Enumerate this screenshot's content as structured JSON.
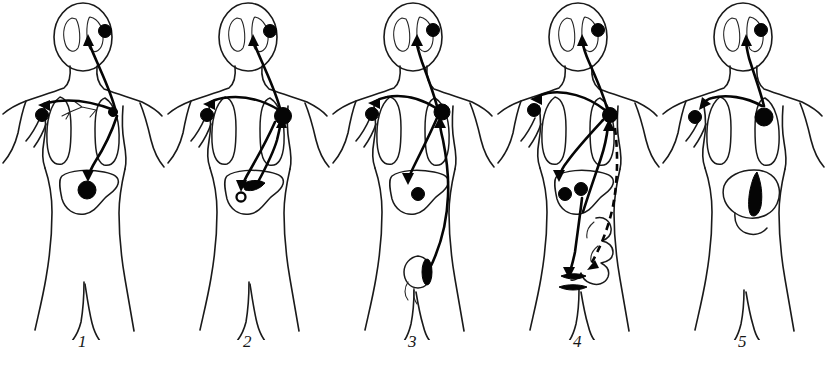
{
  "figure": {
    "panel_count": 5,
    "colors": {
      "ink": "#1a1a1a",
      "lesion_fill": "#050505",
      "background": "#ffffff"
    }
  },
  "panels": [
    {
      "caption": "1",
      "primary_site": "lung",
      "primary_marker": "filled-dot",
      "description": "Lung (bronchial) primary tumour at the right hilum with bronchial tree; metastases to brain, shoulder bone and liver.",
      "metastatic_targets": [
        "brain",
        "shoulder-bone",
        "liver"
      ],
      "markers": [
        {
          "name": "brain-metastasis",
          "type": "filled-dot",
          "site": "brain"
        },
        {
          "name": "shoulder-metastasis",
          "type": "filled-dot",
          "site": "shoulder-bone"
        },
        {
          "name": "lung-primary-tumour",
          "type": "filled-dot",
          "site": "lung"
        },
        {
          "name": "liver-metastasis",
          "type": "filled-dot",
          "site": "liver"
        }
      ]
    },
    {
      "caption": "2",
      "primary_site": "liver",
      "primary_marker": "filled-wedge",
      "description": "Liver primary tumour; spread upward to lung, then to brain and shoulder bone, and an intrahepatic secondary deposit shown as an open ring.",
      "metastatic_targets": [
        "lung",
        "brain",
        "shoulder-bone",
        "liver-secondary"
      ],
      "markers": [
        {
          "name": "brain-metastasis",
          "type": "filled-dot",
          "site": "brain"
        },
        {
          "name": "shoulder-metastasis",
          "type": "filled-dot",
          "site": "shoulder-bone"
        },
        {
          "name": "lung-metastasis",
          "type": "filled-dot",
          "site": "lung"
        },
        {
          "name": "liver-primary-tumour",
          "type": "filled-wedge",
          "site": "liver"
        },
        {
          "name": "liver-secondary-deposit",
          "type": "open-ring",
          "site": "liver"
        }
      ]
    },
    {
      "caption": "3",
      "primary_site": "testis",
      "primary_marker": "filled-oval",
      "description": "Testicular primary tumour; long ascending route to the lung, then secondary spread to brain, shoulder bone and liver.",
      "metastatic_targets": [
        "lung",
        "brain",
        "shoulder-bone",
        "liver"
      ],
      "markers": [
        {
          "name": "brain-metastasis",
          "type": "filled-dot",
          "site": "brain"
        },
        {
          "name": "shoulder-metastasis",
          "type": "filled-dot",
          "site": "shoulder-bone"
        },
        {
          "name": "lung-metastasis",
          "type": "filled-dot",
          "site": "lung"
        },
        {
          "name": "liver-metastasis",
          "type": "filled-dot",
          "site": "liver"
        },
        {
          "name": "testicular-primary-tumour",
          "type": "filled-oval",
          "site": "testis"
        }
      ]
    },
    {
      "caption": "4",
      "primary_site": "intestine",
      "primary_marker": "filled-bar",
      "description": "Intestinal (colonic) primary tumour; portal spread to liver with two deposits, onward to lung, brain and shoulder bone; dashed line marks the secondary return route to the bowel.",
      "metastatic_targets": [
        "liver",
        "lung",
        "brain",
        "shoulder-bone"
      ],
      "markers": [
        {
          "name": "brain-metastasis",
          "type": "filled-dot",
          "site": "brain"
        },
        {
          "name": "shoulder-metastasis",
          "type": "filled-dot",
          "site": "shoulder-bone"
        },
        {
          "name": "lung-metastasis",
          "type": "filled-dot",
          "site": "lung"
        },
        {
          "name": "liver-metastasis-lateral",
          "type": "filled-dot",
          "site": "liver"
        },
        {
          "name": "liver-metastasis-medial",
          "type": "filled-dot",
          "site": "liver"
        },
        {
          "name": "intestinal-primary-tumour",
          "type": "filled-bar",
          "site": "intestine"
        }
      ]
    },
    {
      "caption": "5",
      "primary_site": "stomach",
      "primary_marker": "filled-wedge",
      "description": "Gastric primary tumour shown as a solid black lesion on the lesser curvature; metastases to lung, brain and shoulder bone.",
      "metastatic_targets": [
        "lung",
        "brain",
        "shoulder-bone"
      ],
      "markers": [
        {
          "name": "brain-metastasis",
          "type": "filled-dot",
          "site": "brain"
        },
        {
          "name": "shoulder-metastasis",
          "type": "filled-dot",
          "site": "shoulder-bone"
        },
        {
          "name": "lung-metastasis",
          "type": "filled-dot",
          "site": "lung"
        },
        {
          "name": "stomach-primary-tumour",
          "type": "filled-wedge",
          "site": "stomach"
        }
      ]
    }
  ]
}
